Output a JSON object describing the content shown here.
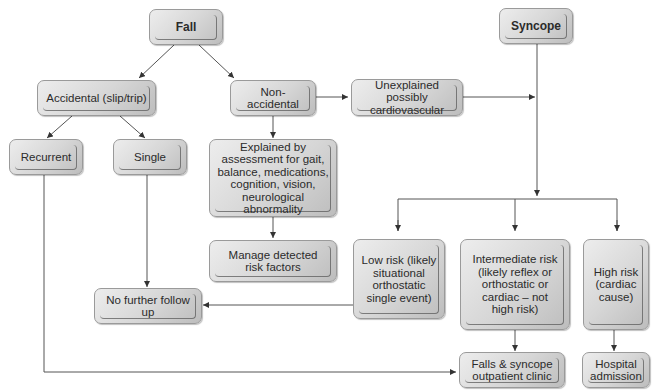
{
  "diagram": {
    "type": "flowchart",
    "nodes": {
      "fall": "Fall",
      "syncope": "Syncope",
      "accidental": "Accidental (slip/trip)",
      "non_accidental": "Non-accidental",
      "unexplained": "Unexplained possibly\ncardiovascular",
      "recurrent": "Recurrent",
      "single": "Single",
      "explained": "Explained by\nassessment for gait,\nbalance, medications,\ncognition, vision,\nneurological abnormality",
      "manage": "Manage detected\nrisk factors",
      "low_risk": "Low risk (likely\nsituational\northostatic\nsingle event)",
      "intermediate_risk": "Intermediate risk\n(likely reflex or\northostatic or\ncardiac – not\nhigh risk)",
      "high_risk": "High risk\n(cardiac\ncause)",
      "no_follow_up": "No further follow up",
      "clinic": "Falls & syncope\noutpatient clinic",
      "hospital": "Hospital\nadmission"
    },
    "edges": [
      [
        "Fall",
        "Accidental (slip/trip)"
      ],
      [
        "Fall",
        "Non-accidental"
      ],
      [
        "Accidental (slip/trip)",
        "Recurrent"
      ],
      [
        "Accidental (slip/trip)",
        "Single"
      ],
      [
        "Non-accidental",
        "Explained by assessment..."
      ],
      [
        "Non-accidental",
        "Unexplained possibly cardiovascular"
      ],
      [
        "Unexplained possibly cardiovascular",
        "Syncope pathway"
      ],
      [
        "Explained by assessment...",
        "Manage detected risk factors"
      ],
      [
        "Syncope",
        "Low risk"
      ],
      [
        "Syncope",
        "Intermediate risk"
      ],
      [
        "Syncope",
        "High risk"
      ],
      [
        "Single",
        "No further follow up"
      ],
      [
        "Low risk",
        "No further follow up"
      ],
      [
        "Recurrent",
        "Falls & syncope outpatient clinic"
      ],
      [
        "Intermediate risk",
        "Falls & syncope outpatient clinic"
      ],
      [
        "High risk",
        "Hospital admission"
      ]
    ]
  }
}
